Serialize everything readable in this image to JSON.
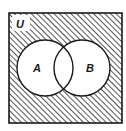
{
  "diagram": {
    "type": "venn",
    "universe_label": "U",
    "sets": [
      {
        "label": "A",
        "cx": 45,
        "cy": 68,
        "r": 28
      },
      {
        "label": "B",
        "cx": 82,
        "cy": 68,
        "r": 28
      }
    ],
    "frame": {
      "x": 9,
      "y": 13,
      "width": 113,
      "height": 110
    },
    "shaded_region": "complement of (A ∪ B)",
    "colors": {
      "line": "#1a1a1a",
      "hatch": "#2a2a2a",
      "background": "#ffffff"
    }
  }
}
